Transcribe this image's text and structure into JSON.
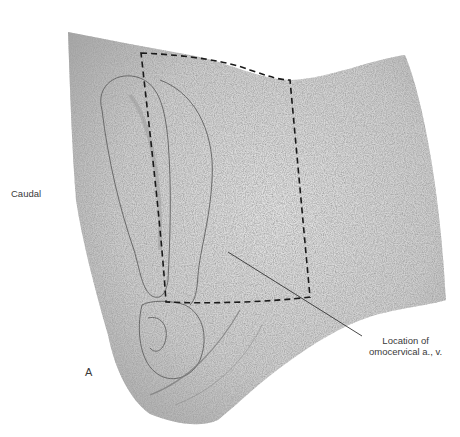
{
  "figure": {
    "panel_label": "A",
    "orientation_label": "Caudal",
    "callout": {
      "line1": "Location of",
      "line2": "omocervical a., v."
    },
    "colors": {
      "background": "#ffffff",
      "fur_base": "#d2d2d2",
      "fur_dark": "#8a8a8a",
      "outline": "#555555",
      "dashed_box": "#1a1a1a",
      "leader_line": "#333333",
      "text": "#3a3a3a"
    }
  }
}
